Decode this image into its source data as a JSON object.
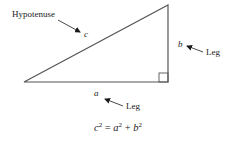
{
  "diagram": {
    "type": "right-triangle",
    "labels": {
      "hypotenuse_label": "Hypotenuse",
      "hypotenuse_var": "c",
      "leg_a_var": "a",
      "leg_a_label": "Leg",
      "leg_b_var": "b",
      "leg_b_label": "Leg"
    },
    "equation": {
      "lhs_base": "c",
      "lhs_exp": "2",
      "equals": " = ",
      "term1_base": "a",
      "term1_exp": "2",
      "plus": " + ",
      "term2_base": "b",
      "term2_exp": "2"
    },
    "colors": {
      "stroke": "#555555",
      "text": "#1a1a1a"
    }
  }
}
